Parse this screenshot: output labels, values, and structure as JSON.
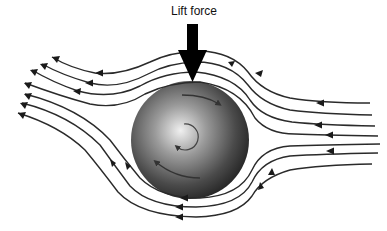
{
  "diagram": {
    "label": "Lift force",
    "colors": {
      "background": "#ffffff",
      "streamline": "#2a2a2a",
      "ball_center": "#e8e8e8",
      "ball_edge": "#2c2c2c",
      "arrow": "#000000"
    },
    "elements": {
      "ball": "spinning sphere with radial gradient",
      "spin_direction": "counter-clockwise",
      "flow_direction": "right to left",
      "streamline_count": 11
    }
  }
}
